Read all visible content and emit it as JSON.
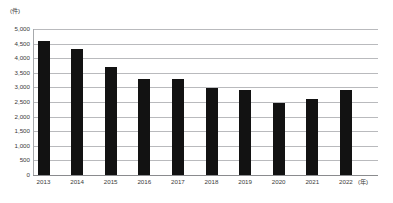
{
  "chart_data": {
    "type": "bar",
    "title": "",
    "xlabel": "(年)",
    "ylabel": "(件)",
    "unit_y": "(件)",
    "unit_x": "(年)",
    "categories": [
      "2013",
      "2014",
      "2015",
      "2016",
      "2017",
      "2018",
      "2019",
      "2020",
      "2021",
      "2022"
    ],
    "values": [
      4600,
      4300,
      3700,
      3300,
      3300,
      2980,
      2900,
      2480,
      2620,
      2900
    ],
    "ylim": [
      0,
      5000
    ],
    "ytick_step": 500,
    "ytick_labels": [
      "5,000",
      "4,500",
      "4,000",
      "3,500",
      "3,000",
      "2,500",
      "2,000",
      "1,500",
      "1,000",
      "500",
      "0"
    ],
    "ytick_values": [
      5000,
      4500,
      4000,
      3500,
      3000,
      2500,
      2000,
      1500,
      1000,
      500,
      0
    ],
    "grid": true,
    "legend": "none",
    "series": [
      {
        "name": "件数",
        "color": "#121212",
        "values": [
          4600,
          4300,
          3700,
          3300,
          3300,
          2980,
          2900,
          2480,
          2620,
          2900
        ]
      }
    ]
  },
  "colors": {
    "bar": "#121212",
    "gridline": "#a7a9ac",
    "baseline": "#6d6e71",
    "text": "#3a3a3a",
    "background": "#ffffff"
  }
}
